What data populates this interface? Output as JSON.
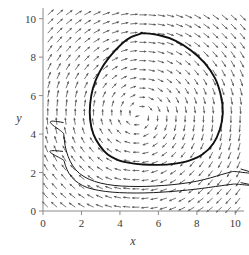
{
  "figure": {
    "type": "phase-portrait",
    "background_color": "#ffffff",
    "axis_color": "#8a8a8a",
    "field_color": "#5a5a5a",
    "trajectory_color": "#1a1a1a"
  },
  "chart_data": {
    "type": "scatter",
    "plot_kind": "vector-field-phase-portrait",
    "title": "",
    "subtitle": "",
    "xlabel": "x",
    "ylabel": "y",
    "xlim": [
      0,
      10.4
    ],
    "ylim": [
      0,
      10.4
    ],
    "xticks": [
      0,
      2,
      4,
      6,
      8,
      10
    ],
    "yticks": [
      0,
      2,
      4,
      6,
      8,
      10
    ],
    "xtick_labels": [
      "0",
      "2",
      "4",
      "6",
      "8",
      "10"
    ],
    "ytick_labels": [
      "0",
      "2",
      "4",
      "6",
      "8",
      "10"
    ],
    "grid": false,
    "legend": null,
    "legend_position": "none",
    "annotations": [],
    "vector_field": {
      "description": "normalized direction field arrows on a uniform grid, clockwise rotation about an equilibrium center",
      "equilibrium_center": [
        5.0,
        5.0
      ],
      "rotation": "clockwise",
      "grid_nx": 22,
      "grid_ny": 22,
      "x_start": 0.25,
      "x_end": 10.25,
      "y_start": 0.2,
      "y_end": 10.2,
      "arrow_length": 8.0,
      "model": "lotka-volterra-like",
      "vx_formula": "y - 5",
      "vy_formula": "-(x - 5)",
      "damping_exponent": 0.55
    },
    "series": [
      {
        "name": "limit-cycle",
        "kind": "closed-orbit",
        "line_width": 1.9,
        "color": "#111111",
        "points": [
          [
            5.15,
            9.25
          ],
          [
            6.0,
            9.15
          ],
          [
            6.9,
            8.85
          ],
          [
            7.7,
            8.35
          ],
          [
            8.4,
            7.7
          ],
          [
            8.95,
            6.9
          ],
          [
            9.25,
            6.0
          ],
          [
            9.35,
            5.1
          ],
          [
            9.2,
            4.25
          ],
          [
            8.85,
            3.5
          ],
          [
            8.3,
            2.95
          ],
          [
            7.6,
            2.62
          ],
          [
            6.8,
            2.45
          ],
          [
            6.0,
            2.4
          ],
          [
            5.2,
            2.42
          ],
          [
            4.5,
            2.5
          ],
          [
            3.9,
            2.65
          ],
          [
            3.35,
            2.95
          ],
          [
            2.95,
            3.4
          ],
          [
            2.62,
            4.0
          ],
          [
            2.45,
            4.75
          ],
          [
            2.45,
            5.55
          ],
          [
            2.6,
            6.4
          ],
          [
            2.95,
            7.25
          ],
          [
            3.45,
            8.0
          ],
          [
            4.1,
            8.7
          ],
          [
            4.6,
            9.05
          ],
          [
            5.15,
            9.25
          ]
        ]
      },
      {
        "name": "trajectory-upper",
        "kind": "open-orbit",
        "line_width": 1.0,
        "color": "#1a1a1a",
        "points": [
          [
            1.05,
            4.6
          ],
          [
            1.08,
            4.0
          ],
          [
            1.15,
            3.4
          ],
          [
            1.3,
            2.85
          ],
          [
            1.55,
            2.35
          ],
          [
            1.9,
            1.95
          ],
          [
            2.4,
            1.65
          ],
          [
            3.0,
            1.45
          ],
          [
            3.7,
            1.33
          ],
          [
            4.5,
            1.28
          ],
          [
            5.4,
            1.28
          ],
          [
            6.3,
            1.33
          ],
          [
            7.2,
            1.42
          ],
          [
            8.0,
            1.55
          ],
          [
            8.7,
            1.72
          ],
          [
            9.3,
            1.9
          ],
          [
            9.85,
            2.05
          ],
          [
            10.3,
            2.18
          ]
        ]
      },
      {
        "name": "trajectory-lower",
        "kind": "open-orbit",
        "line_width": 1.0,
        "color": "#1a1a1a",
        "points": [
          [
            1.02,
            3.1
          ],
          [
            1.1,
            2.6
          ],
          [
            1.25,
            2.15
          ],
          [
            1.5,
            1.75
          ],
          [
            1.85,
            1.45
          ],
          [
            2.3,
            1.22
          ],
          [
            2.9,
            1.07
          ],
          [
            3.6,
            0.98
          ],
          [
            4.4,
            0.94
          ],
          [
            5.3,
            0.94
          ],
          [
            6.2,
            0.98
          ],
          [
            7.1,
            1.05
          ],
          [
            7.9,
            1.13
          ],
          [
            8.6,
            1.22
          ],
          [
            9.3,
            1.32
          ],
          [
            9.9,
            1.4
          ],
          [
            10.3,
            1.47
          ]
        ]
      }
    ]
  }
}
